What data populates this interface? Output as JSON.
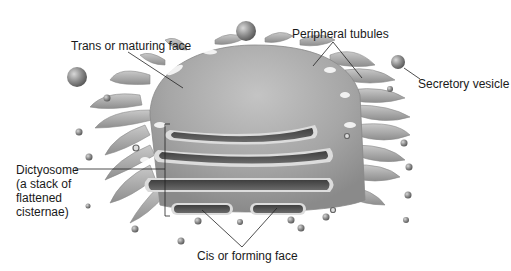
{
  "diagram": {
    "labels": {
      "trans_face": "Trans or maturing face",
      "peripheral_tubules": "Peripheral tubules",
      "secretory_vesicle": "Secretory vesicle",
      "dictyosome_line1": "Dictyosome",
      "dictyosome_line2": "(a stack of",
      "dictyosome_line3": "flattened",
      "dictyosome_line4": "cisternae)",
      "cis_face": "Cis or forming face"
    },
    "colors": {
      "background": "#ffffff",
      "membrane_light": "#b8b8b8",
      "membrane_mid": "#9a9a9a",
      "membrane_dark": "#6e6e6e",
      "lumen": "#4a4a4a",
      "leader_line": "#222222",
      "text": "#1a1a1a"
    }
  }
}
